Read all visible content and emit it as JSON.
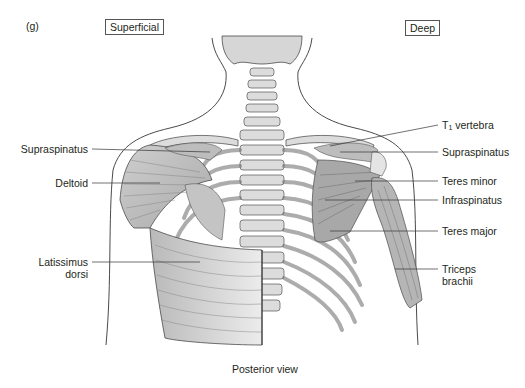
{
  "figure": {
    "panel_label": "(g)",
    "caption": "Posterior view",
    "sections": {
      "left": "Superficial",
      "right": "Deep"
    }
  },
  "labels": {
    "left": [
      {
        "text": "Supraspinatus"
      },
      {
        "text": "Deltoid"
      },
      {
        "text_line1": "Latissimus",
        "text_line2": "dorsi"
      }
    ],
    "right": [
      {
        "text_main": "T",
        "text_sub": "1",
        "text_rest": " vertebra"
      },
      {
        "text": "Supraspinatus"
      },
      {
        "text": "Teres minor"
      },
      {
        "text": "Infraspinatus"
      },
      {
        "text": "Teres major"
      },
      {
        "text_line1": "Triceps",
        "text_line2": "brachii"
      }
    ]
  },
  "colors": {
    "outline": "#4a4a4a",
    "bone": "#dcdcdc",
    "muscle": "#c8c8c8",
    "leader": "#333333"
  }
}
